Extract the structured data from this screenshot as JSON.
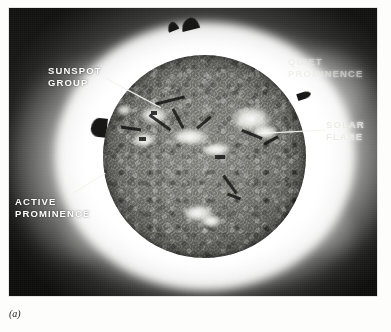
{
  "figure": {
    "caption_label": "(a)",
    "medium": "black-and-white halftone plate"
  },
  "colors": {
    "page_background": "#fdfdfb",
    "sky_dark": "#111110",
    "corona_white": "#ffffff",
    "disk_grey": "#82827d",
    "label_text": "#ffffff",
    "leader_line": "#f2f2ee",
    "caption_text": "#1a1a1a"
  },
  "annotations": [
    {
      "id": "sunspot-group",
      "label": "SUNSPOT\nGROUP",
      "label_x": 48,
      "label_y": 65,
      "leader": {
        "x": 106,
        "y": 78,
        "length": 62,
        "angle": 28
      },
      "target_feature": "dark sunspot umbra within a bright plage on the upper-left quadrant of the disk",
      "style": "bright"
    },
    {
      "id": "quiet-prominence",
      "label": "QUIET\nPROMINENCE",
      "label_x": 288,
      "label_y": 56,
      "leader": null,
      "target_feature": "dark prominence arch on the upper-right limb",
      "style": "washed-out"
    },
    {
      "id": "solar-flare",
      "label": "SOLAR\nFLARE",
      "label_x": 326,
      "label_y": 119,
      "leader": {
        "x": 258,
        "y": 133,
        "length": 68,
        "angle": -3
      },
      "target_feature": "brilliant white flare region right of disk centre",
      "style": "washed-out"
    },
    {
      "id": "active-prominence",
      "label": "ACTIVE\nPROMINENCE",
      "label_x": 15,
      "label_y": 196,
      "leader": {
        "x": 68,
        "y": 196,
        "length": 44,
        "angle": -32
      },
      "target_feature": "eruptive prominence on the left limb",
      "style": "bright"
    }
  ],
  "disk": {
    "center_x": 195,
    "center_y": 148,
    "radius": 101,
    "plages": [
      {
        "x": 38,
        "y": 52,
        "w": 26,
        "h": 17
      },
      {
        "x": 30,
        "y": 78,
        "w": 22,
        "h": 14
      },
      {
        "x": 70,
        "y": 74,
        "w": 34,
        "h": 16
      },
      {
        "x": 98,
        "y": 88,
        "w": 30,
        "h": 13
      },
      {
        "x": 128,
        "y": 52,
        "w": 40,
        "h": 24
      },
      {
        "x": 150,
        "y": 70,
        "w": 24,
        "h": 14
      },
      {
        "x": 80,
        "y": 150,
        "w": 30,
        "h": 16
      },
      {
        "x": 98,
        "y": 160,
        "w": 20,
        "h": 12
      },
      {
        "x": 14,
        "y": 50,
        "w": 14,
        "h": 10
      }
    ],
    "filaments": [
      {
        "x": 52,
        "y": 44,
        "w": 30,
        "h": 3,
        "rot": -14
      },
      {
        "x": 44,
        "y": 66,
        "w": 26,
        "h": 3,
        "rot": 36
      },
      {
        "x": 18,
        "y": 72,
        "w": 20,
        "h": 3,
        "rot": 8
      },
      {
        "x": 64,
        "y": 62,
        "w": 22,
        "h": 3,
        "rot": 62
      },
      {
        "x": 92,
        "y": 66,
        "w": 18,
        "h": 3,
        "rot": -40
      },
      {
        "x": 112,
        "y": 100,
        "w": 10,
        "h": 4,
        "rot": 0
      },
      {
        "x": 138,
        "y": 78,
        "w": 22,
        "h": 3,
        "rot": 22
      },
      {
        "x": 160,
        "y": 84,
        "w": 16,
        "h": 3,
        "rot": -28
      },
      {
        "x": 116,
        "y": 128,
        "w": 22,
        "h": 3,
        "rot": 54
      },
      {
        "x": 124,
        "y": 140,
        "w": 14,
        "h": 3,
        "rot": 20
      }
    ]
  }
}
